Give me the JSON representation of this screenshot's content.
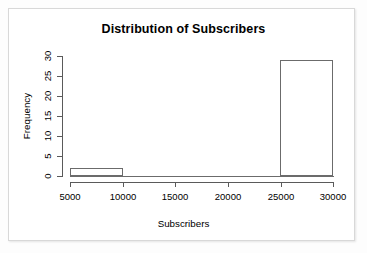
{
  "figure": {
    "background_color": "#ffffff",
    "frame_color": "#d8d8d8",
    "line_color": "#6b6b6b"
  },
  "chart_data": {
    "type": "bar",
    "chart_subtype": "histogram",
    "title": "Distribution of Subscribers",
    "xlabel": "Subscribers",
    "ylabel": "Frequency",
    "xlim": [
      5000,
      30000
    ],
    "ylim": [
      0,
      30
    ],
    "grid": false,
    "legend": null,
    "x_ticks": [
      5000,
      10000,
      15000,
      20000,
      25000,
      30000
    ],
    "x_tick_labels": [
      "5000",
      "10000",
      "15000",
      "20000",
      "25000",
      "30000"
    ],
    "y_ticks": [
      0,
      5,
      10,
      15,
      20,
      25,
      30
    ],
    "y_tick_labels": [
      "0",
      "5",
      "10",
      "15",
      "20",
      "25",
      "30"
    ],
    "bin_width": 5000,
    "bins": [
      {
        "label": "5000-10000",
        "bin_start": 5000,
        "bin_end": 10000,
        "value": 2
      },
      {
        "label": "10000-15000",
        "bin_start": 10000,
        "bin_end": 15000,
        "value": 0
      },
      {
        "label": "15000-20000",
        "bin_start": 15000,
        "bin_end": 20000,
        "value": 0
      },
      {
        "label": "20000-25000",
        "bin_start": 20000,
        "bin_end": 25000,
        "value": 0
      },
      {
        "label": "25000-30000",
        "bin_start": 25000,
        "bin_end": 30000,
        "value": 29
      }
    ],
    "categories": [
      "5000-10000",
      "10000-15000",
      "15000-20000",
      "20000-25000",
      "25000-30000"
    ],
    "values": [
      2,
      0,
      0,
      0,
      29
    ]
  }
}
